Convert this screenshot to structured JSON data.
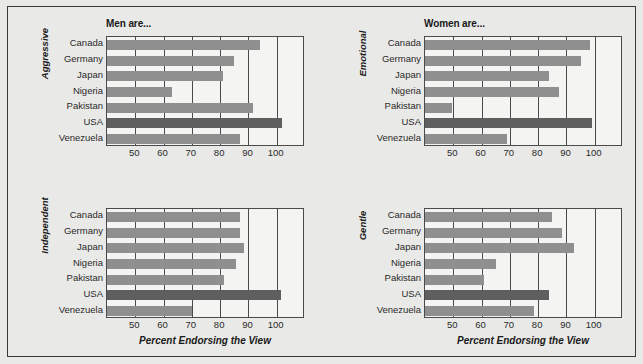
{
  "figure": {
    "background_color": "#e9e9e7",
    "bar_color": "#8f8f8f",
    "highlight_bar_color": "#5f5f5f",
    "highlight_category": "USA"
  },
  "chart_data": {
    "type": "bar",
    "orientation": "horizontal",
    "title": "",
    "categories": [
      "Canada",
      "Germany",
      "Japan",
      "Nigeria",
      "Pakistan",
      "USA",
      "Venezuela"
    ],
    "xlabel": "Percent Endorsing the View",
    "xlim": [
      40,
      110
    ],
    "xticks": [
      50,
      60,
      70,
      80,
      90,
      100
    ],
    "xtick_labels": [
      "50",
      "60",
      "70",
      "80",
      "90",
      "100"
    ],
    "grid": true,
    "legend": "none",
    "panels": [
      {
        "position": "top-left",
        "title": "Men are...",
        "ylabel": "Aggressive",
        "values": [
          94,
          85,
          81,
          63,
          91.5,
          102,
          87
        ]
      },
      {
        "position": "top-right",
        "title": "Women are...",
        "ylabel": "Emotional",
        "values": [
          98.5,
          95,
          84,
          87.5,
          49.5,
          99,
          69
        ]
      },
      {
        "position": "bottom-left",
        "title": "",
        "ylabel": "Independent",
        "xlabel": "Percent Endorsing the View",
        "values": [
          87,
          87,
          88.5,
          85.5,
          81.5,
          101.5,
          70
        ]
      },
      {
        "position": "bottom-right",
        "title": "",
        "ylabel": "Gentle",
        "xlabel": "Percent Endorsing the View",
        "values": [
          85,
          88.5,
          92.5,
          65,
          61,
          84,
          78.5
        ]
      }
    ]
  }
}
